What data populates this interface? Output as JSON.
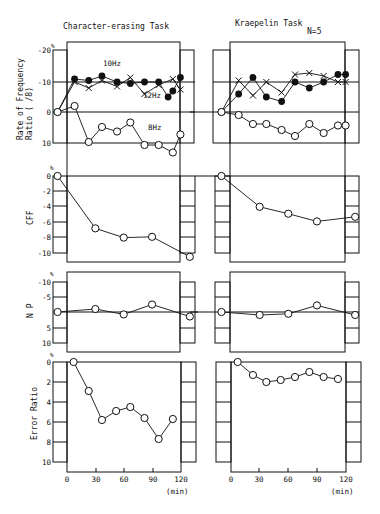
{
  "figure": {
    "left_title": "Character-erasing Task",
    "right_title": "Kraepelin Task",
    "n_label": "N=5",
    "x_unit": "(min)",
    "x_ticks": [
      "0",
      "30",
      "60",
      "90",
      "120"
    ]
  },
  "panels": {
    "freq": {
      "ylabel_line1": "Rate of Frequency",
      "ylabel_line2": "Ratio ( /8)",
      "unit": "%",
      "y_ticks": [
        "-20",
        "-10",
        "0",
        "10"
      ],
      "label_10hz": "10Hz",
      "label_12hz": "12Hz",
      "label_8hz": "8Hz"
    },
    "cff": {
      "ylabel": "CFF",
      "unit": "%",
      "y_ticks": [
        "0",
        "-2",
        "-4",
        "-6",
        "-8",
        "-10"
      ]
    },
    "np": {
      "ylabel": "N P",
      "unit": "%",
      "y_ticks": [
        "-10",
        "-5",
        "",
        "5",
        "10"
      ]
    },
    "error": {
      "ylabel": "Error Ratio",
      "unit": "%",
      "y_ticks": [
        "0",
        "2",
        "4",
        "6",
        "8",
        "10"
      ]
    }
  },
  "chart_data": [
    {
      "type": "line",
      "title": "Character-erasing Task — Rate of Frequency Ratio (/8)",
      "xlabel": "(min)",
      "ylabel": "Rate of Frequency Ratio ( /8) %",
      "ylim": [
        10,
        -20
      ],
      "xlim": [
        0,
        120
      ],
      "series": [
        {
          "name": "10Hz",
          "marker": "filled-circle",
          "x": [
            -10,
            8,
            23,
            37,
            53,
            67,
            82,
            97,
            107,
            112,
            120
          ],
          "y": [
            0,
            -11,
            -10.5,
            -12,
            -10,
            -9.5,
            -10,
            -10,
            -5,
            -7,
            -11.5
          ]
        },
        {
          "name": "12Hz",
          "marker": "x",
          "x": [
            -10,
            8,
            23,
            37,
            53,
            67,
            82,
            97,
            112,
            120
          ],
          "y": [
            0,
            -10,
            -8,
            -10.5,
            -8.5,
            -11.5,
            -6,
            -9,
            -11,
            -7.5
          ]
        },
        {
          "name": "8Hz",
          "marker": "open-circle",
          "x": [
            -10,
            8,
            23,
            37,
            53,
            67,
            82,
            97,
            112,
            120
          ],
          "y": [
            0,
            -2,
            10,
            5,
            6.5,
            3.5,
            11,
            11,
            13.5,
            7.5
          ]
        }
      ]
    },
    {
      "type": "line",
      "title": "Kraepelin Task — Rate of Frequency Ratio (/8)",
      "xlabel": "(min)",
      "ylabel": "Rate of Frequency Ratio ( /8) %",
      "ylim": [
        10,
        -20
      ],
      "xlim": [
        0,
        120
      ],
      "series": [
        {
          "name": "10Hz",
          "marker": "filled-circle",
          "x": [
            -10,
            8,
            23,
            37,
            53,
            67,
            82,
            97,
            112,
            120
          ],
          "y": [
            0,
            -6,
            -11.5,
            -5,
            -3.5,
            -10,
            -8,
            -10,
            -12.5,
            -12.5
          ]
        },
        {
          "name": "12Hz",
          "marker": "x",
          "x": [
            -10,
            8,
            23,
            37,
            53,
            67,
            82,
            97,
            112,
            120
          ],
          "y": [
            0,
            -10.5,
            -5.5,
            -10,
            -6.5,
            -12.5,
            -13,
            -12,
            -10,
            -10
          ]
        },
        {
          "name": "8Hz",
          "marker": "open-circle",
          "x": [
            -10,
            8,
            23,
            37,
            53,
            67,
            82,
            97,
            112,
            120
          ],
          "y": [
            0,
            1,
            4,
            4,
            6,
            8,
            4,
            7,
            4.5,
            4.5
          ]
        }
      ]
    },
    {
      "type": "line",
      "title": "Character-erasing Task — CFF",
      "ylabel": "CFF %",
      "ylim": [
        0,
        -10
      ],
      "xlim": [
        0,
        120
      ],
      "series": [
        {
          "name": "CFF",
          "marker": "open-circle",
          "x": [
            -10,
            30,
            60,
            90,
            130
          ],
          "y": [
            0,
            -6.8,
            -8,
            -7.9,
            -10.5
          ]
        }
      ]
    },
    {
      "type": "line",
      "title": "Kraepelin Task — CFF",
      "ylabel": "CFF %",
      "ylim": [
        0,
        -10
      ],
      "xlim": [
        0,
        120
      ],
      "series": [
        {
          "name": "CFF",
          "marker": "open-circle",
          "x": [
            -10,
            30,
            60,
            90,
            130
          ],
          "y": [
            0,
            -4,
            -4.9,
            -5.9,
            -5.3
          ]
        }
      ]
    },
    {
      "type": "line",
      "title": "Character-erasing Task — N P",
      "ylabel": "N P %",
      "ylim": [
        -10,
        10
      ],
      "xlim": [
        0,
        120
      ],
      "series": [
        {
          "name": "NP",
          "marker": "open-circle",
          "x": [
            -10,
            30,
            60,
            90,
            130
          ],
          "y": [
            0,
            -1,
            0.8,
            -2.5,
            1.5
          ]
        }
      ]
    },
    {
      "type": "line",
      "title": "Kraepelin Task — N P",
      "ylabel": "N P %",
      "ylim": [
        -10,
        10
      ],
      "xlim": [
        0,
        120
      ],
      "series": [
        {
          "name": "NP",
          "marker": "open-circle",
          "x": [
            -10,
            30,
            60,
            90,
            130
          ],
          "y": [
            0,
            1,
            0.6,
            -2.2,
            1
          ]
        }
      ]
    },
    {
      "type": "line",
      "title": "Character-erasing Task — Error Ratio",
      "ylabel": "Error Ratio %",
      "xlabel": "(min)",
      "ylim": [
        0,
        10
      ],
      "xlim": [
        0,
        120
      ],
      "series": [
        {
          "name": "Error Ratio",
          "marker": "open-circle",
          "x": [
            7,
            23,
            37,
            52,
            67,
            82,
            97,
            112
          ],
          "y": [
            0,
            2.9,
            5.8,
            4.9,
            4.5,
            5.6,
            7.7,
            5.7
          ]
        }
      ]
    },
    {
      "type": "line",
      "title": "Kraepelin Task — Error Ratio",
      "ylabel": "Error Ratio %",
      "xlabel": "(min)",
      "ylim": [
        0,
        10
      ],
      "xlim": [
        0,
        120
      ],
      "series": [
        {
          "name": "Error Ratio",
          "marker": "open-circle",
          "x": [
            7,
            23,
            37,
            52,
            67,
            82,
            97,
            112
          ],
          "y": [
            0,
            1.3,
            2,
            1.8,
            1.5,
            1,
            1.5,
            1.7
          ]
        }
      ]
    }
  ]
}
